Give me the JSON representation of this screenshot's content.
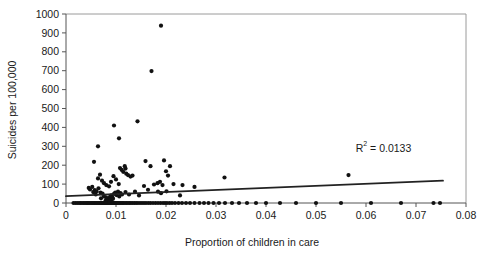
{
  "chart_data": {
    "type": "scatter",
    "title": "",
    "xlabel": "Proportion of children in care",
    "ylabel": "Suicides per 100,000",
    "xlim": [
      0,
      0.08
    ],
    "ylim": [
      0,
      1000
    ],
    "xticks": [
      0,
      0.01,
      0.02,
      0.03,
      0.04,
      0.05,
      0.06,
      0.07,
      0.08
    ],
    "xtick_labels": [
      "0",
      "0.01",
      "0.02",
      "0.03",
      "0.04",
      "0.05",
      "0.06",
      "0.07",
      "0.08"
    ],
    "yticks": [
      0,
      100,
      200,
      300,
      400,
      500,
      600,
      700,
      800,
      900,
      1000
    ],
    "ytick_labels": [
      "0",
      "100",
      "200",
      "300",
      "400",
      "500",
      "600",
      "700",
      "800",
      "900",
      "1000"
    ],
    "grid": false,
    "legend": false,
    "marker_color": "#111111",
    "marker_size": 2.1,
    "annotations": [
      {
        "name": "r-squared",
        "text_prefix": "R",
        "text_sup": "2",
        "text_suffix": " = 0.0133",
        "full_text": "R2 = 0.0133",
        "x": 0.0635,
        "y": 270
      }
    ],
    "trendline": {
      "name": "linear-fit",
      "color": "#222222",
      "x_start": 0.0,
      "y_start": 36,
      "x_end": 0.0754,
      "y_end": 118,
      "equation_r2": 0.0133
    },
    "points": [
      [
        0.0015,
        0
      ],
      [
        0.0019,
        0
      ],
      [
        0.00225,
        0
      ],
      [
        0.0026,
        0
      ],
      [
        0.0029,
        0
      ],
      [
        0.0032,
        0
      ],
      [
        0.0035,
        0
      ],
      [
        0.0038,
        0
      ],
      [
        0.00405,
        0
      ],
      [
        0.0043,
        0
      ],
      [
        0.00455,
        0
      ],
      [
        0.0048,
        0
      ],
      [
        0.00505,
        0
      ],
      [
        0.0053,
        0
      ],
      [
        0.00555,
        0
      ],
      [
        0.00575,
        0
      ],
      [
        0.006,
        0
      ],
      [
        0.0062,
        0
      ],
      [
        0.00645,
        0
      ],
      [
        0.00665,
        0
      ],
      [
        0.0069,
        0
      ],
      [
        0.0071,
        0
      ],
      [
        0.0073,
        0
      ],
      [
        0.0075,
        0
      ],
      [
        0.0077,
        0
      ],
      [
        0.0079,
        0
      ],
      [
        0.0081,
        0
      ],
      [
        0.0083,
        0
      ],
      [
        0.0085,
        0
      ],
      [
        0.0087,
        0
      ],
      [
        0.0089,
        0
      ],
      [
        0.0091,
        0
      ],
      [
        0.0093,
        0
      ],
      [
        0.0095,
        0
      ],
      [
        0.0097,
        0
      ],
      [
        0.0099,
        0
      ],
      [
        0.0101,
        0
      ],
      [
        0.0103,
        0
      ],
      [
        0.0105,
        0
      ],
      [
        0.01075,
        0
      ],
      [
        0.011,
        0
      ],
      [
        0.01125,
        0
      ],
      [
        0.0115,
        0
      ],
      [
        0.0118,
        0
      ],
      [
        0.0121,
        0
      ],
      [
        0.0124,
        0
      ],
      [
        0.0127,
        0
      ],
      [
        0.013,
        0
      ],
      [
        0.01335,
        0
      ],
      [
        0.0137,
        0
      ],
      [
        0.01405,
        0
      ],
      [
        0.0144,
        0
      ],
      [
        0.0148,
        0
      ],
      [
        0.0152,
        0
      ],
      [
        0.0156,
        0
      ],
      [
        0.016,
        0
      ],
      [
        0.01645,
        0
      ],
      [
        0.0169,
        0
      ],
      [
        0.0174,
        0
      ],
      [
        0.0179,
        0
      ],
      [
        0.0184,
        0
      ],
      [
        0.0189,
        0
      ],
      [
        0.0194,
        0
      ],
      [
        0.0198,
        0
      ],
      [
        0.0202,
        0
      ],
      [
        0.0207,
        0
      ],
      [
        0.0212,
        0
      ],
      [
        0.0218,
        0
      ],
      [
        0.0225,
        0
      ],
      [
        0.0232,
        0
      ],
      [
        0.024,
        0
      ],
      [
        0.0248,
        0
      ],
      [
        0.0257,
        0
      ],
      [
        0.0267,
        0
      ],
      [
        0.0276,
        0
      ],
      [
        0.0285,
        0
      ],
      [
        0.0295,
        0
      ],
      [
        0.0306,
        0
      ],
      [
        0.0318,
        0
      ],
      [
        0.0332,
        0
      ],
      [
        0.0346,
        0
      ],
      [
        0.0362,
        0
      ],
      [
        0.038,
        0
      ],
      [
        0.04,
        0
      ],
      [
        0.0428,
        0
      ],
      [
        0.046,
        0
      ],
      [
        0.05,
        0
      ],
      [
        0.055,
        0
      ],
      [
        0.061,
        0
      ],
      [
        0.067,
        0
      ],
      [
        0.0735,
        0
      ],
      [
        0.0748,
        0
      ],
      [
        0.0079,
        12
      ],
      [
        0.0082,
        18
      ],
      [
        0.0085,
        25
      ],
      [
        0.0088,
        32
      ],
      [
        0.00905,
        40
      ],
      [
        0.0093,
        28
      ],
      [
        0.0096,
        48
      ],
      [
        0.00985,
        55
      ],
      [
        0.0101,
        42
      ],
      [
        0.0104,
        60
      ],
      [
        0.01065,
        35
      ],
      [
        0.0109,
        52
      ],
      [
        0.0112,
        45
      ],
      [
        0.0087,
        8
      ],
      [
        0.009,
        15
      ],
      [
        0.0094,
        22
      ],
      [
        0.0048,
        72
      ],
      [
        0.00525,
        85
      ],
      [
        0.00575,
        68
      ],
      [
        0.0061,
        62
      ],
      [
        0.0065,
        78
      ],
      [
        0.0069,
        55
      ],
      [
        0.0073,
        50
      ],
      [
        0.00545,
        58
      ],
      [
        0.00595,
        45
      ],
      [
        0.00455,
        80
      ],
      [
        0.0064,
        130
      ],
      [
        0.0068,
        150
      ],
      [
        0.0072,
        118
      ],
      [
        0.0076,
        105
      ],
      [
        0.00805,
        95
      ],
      [
        0.0086,
        88
      ],
      [
        0.009,
        112
      ],
      [
        0.0095,
        142
      ],
      [
        0.01,
        125
      ],
      [
        0.01055,
        100
      ],
      [
        0.0108,
        185
      ],
      [
        0.01115,
        175
      ],
      [
        0.01145,
        165
      ],
      [
        0.01175,
        195
      ],
      [
        0.01205,
        155
      ],
      [
        0.0124,
        148
      ],
      [
        0.0129,
        140
      ],
      [
        0.0133,
        145
      ],
      [
        0.0056,
        218
      ],
      [
        0.0064,
        300
      ],
      [
        0.0096,
        410
      ],
      [
        0.0106,
        342
      ],
      [
        0.0119,
        182
      ],
      [
        0.0143,
        432
      ],
      [
        0.0159,
        222
      ],
      [
        0.0169,
        195
      ],
      [
        0.0156,
        90
      ],
      [
        0.0164,
        70
      ],
      [
        0.0176,
        98
      ],
      [
        0.0183,
        105
      ],
      [
        0.0188,
        112
      ],
      [
        0.0193,
        95
      ],
      [
        0.0196,
        225
      ],
      [
        0.02,
        168
      ],
      [
        0.0204,
        145
      ],
      [
        0.0208,
        195
      ],
      [
        0.0184,
        60
      ],
      [
        0.019,
        52
      ],
      [
        0.0201,
        62
      ],
      [
        0.0215,
        100
      ],
      [
        0.0228,
        40
      ],
      [
        0.0233,
        95
      ],
      [
        0.0257,
        85
      ],
      [
        0.0171,
        698
      ],
      [
        0.019,
        938
      ],
      [
        0.0317,
        135
      ],
      [
        0.0565,
        148
      ],
      [
        0.0138,
        60
      ],
      [
        0.0146,
        40
      ],
      [
        0.0119,
        58
      ],
      [
        0.0126,
        45
      ],
      [
        0.0076,
        35
      ],
      [
        0.008,
        30
      ],
      [
        0.007,
        25
      ]
    ]
  }
}
